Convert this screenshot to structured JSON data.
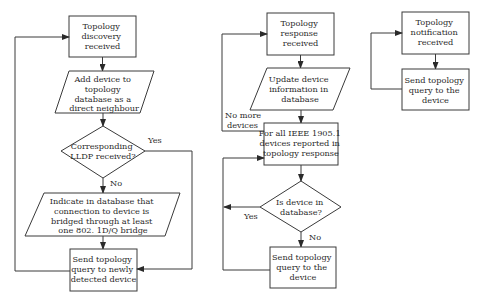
{
  "diagram": {
    "type": "flowchart",
    "colors": {
      "stroke": "#3a3a3a",
      "fill": "#ffffff",
      "text": "#2a2a2a"
    },
    "flow1": {
      "topology_discovery": [
        "Topology",
        "discovery",
        "received"
      ],
      "add_device": [
        "Add device to",
        "topology",
        "database as a",
        "direct neighbour"
      ],
      "lldp_decision": [
        "Corresponding",
        "LLDP received?"
      ],
      "indicate_bridged": [
        "Indicate in database that",
        "connection to device is",
        "bridged through at least",
        "one 802. 1D/Q bridge"
      ],
      "send_query_new": [
        "Send topology",
        "query to newly",
        "detected device"
      ],
      "yes_label": "Yes",
      "no_label": "No"
    },
    "flow2": {
      "topology_response": [
        "Topology",
        "response",
        "received"
      ],
      "update_device": [
        "Update device",
        "information in",
        "database"
      ],
      "for_all": [
        "For all IEEE 1905.1",
        "devices reported in",
        "topology response"
      ],
      "in_db_decision": [
        "Is device in",
        "database?"
      ],
      "send_query": [
        "Send topology",
        "query to the",
        "device"
      ],
      "no_more_label": [
        "No more",
        "devices"
      ],
      "yes_label": "Yes",
      "no_label": "No"
    },
    "flow3": {
      "topology_notification": [
        "Topology",
        "notification",
        "received"
      ],
      "send_query": [
        "Send topology",
        "query to the",
        "device"
      ]
    }
  }
}
